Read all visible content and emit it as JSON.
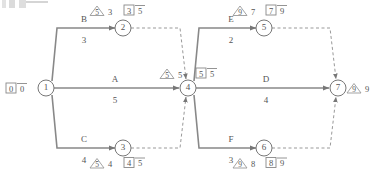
{
  "diagram": {
    "kind": "activity-on-arrow-network",
    "nodes": [
      {
        "id": "n1",
        "label": "1",
        "cx": 46,
        "cy": 88,
        "box": {
          "early": "0",
          "late": "0"
        },
        "box_pos": {
          "x": 14,
          "y": 88
        },
        "triangle": null
      },
      {
        "id": "n2",
        "label": "2",
        "cx": 123,
        "cy": 28,
        "box": {
          "early": "3",
          "late": "5"
        },
        "box_pos": {
          "x": 139,
          "y": 11
        },
        "triangle": {
          "value": "5",
          "number": "3",
          "x": 98,
          "y": 11
        }
      },
      {
        "id": "n3",
        "label": "3",
        "cx": 123,
        "cy": 148,
        "box": {
          "early": "4",
          "late": "5"
        },
        "box_pos": {
          "x": 139,
          "y": 165
        },
        "triangle": {
          "value": "5",
          "number": "4",
          "x": 98,
          "y": 165
        }
      },
      {
        "id": "n4",
        "label": "4",
        "cx": 188,
        "cy": 88,
        "box": {
          "early": "5",
          "late": "5"
        },
        "box_pos": {
          "x": 212,
          "y": 71
        },
        "triangle": {
          "value": "5",
          "number": "5",
          "x": 170,
          "y": 71
        }
      },
      {
        "id": "n5",
        "label": "5",
        "cx": 264,
        "cy": 28,
        "box": {
          "early": "7",
          "late": "9"
        },
        "box_pos": {
          "x": 281,
          "y": 11
        },
        "triangle": {
          "value": "9",
          "number": "7",
          "x": 241,
          "y": 11
        }
      },
      {
        "id": "n6",
        "label": "6",
        "cx": 264,
        "cy": 148,
        "box": {
          "early": "8",
          "late": "9"
        },
        "box_pos": {
          "x": 281,
          "y": 165
        },
        "triangle": {
          "value": "9",
          "number": "8",
          "x": 241,
          "y": 165
        }
      },
      {
        "id": "n7",
        "label": "7",
        "cx": 338,
        "cy": 88,
        "box": null,
        "box_pos": null,
        "triangle": {
          "value": "9",
          "number": "9",
          "x": 353,
          "y": 88
        }
      }
    ],
    "activities": [
      {
        "id": "B",
        "name": "B",
        "duration": "3",
        "from": "n1",
        "to": "n2",
        "name_pos": {
          "x": 84,
          "y": 22
        },
        "dur_pos": {
          "x": 84,
          "y": 43
        }
      },
      {
        "id": "A",
        "name": "A",
        "duration": "5",
        "from": "n1",
        "to": "n4",
        "name_pos": {
          "x": 115,
          "y": 82
        },
        "dur_pos": {
          "x": 115,
          "y": 103
        }
      },
      {
        "id": "C",
        "name": "C",
        "duration": "4",
        "from": "n1",
        "to": "n3",
        "name_pos": {
          "x": 84,
          "y": 142
        },
        "dur_pos": {
          "x": 84,
          "y": 163
        }
      },
      {
        "id": "E",
        "name": "E",
        "duration": "2",
        "from": "n4",
        "to": "n5",
        "name_pos": {
          "x": 231,
          "y": 22
        },
        "dur_pos": {
          "x": 231,
          "y": 43
        }
      },
      {
        "id": "D",
        "name": "D",
        "duration": "4",
        "from": "n4",
        "to": "n7",
        "name_pos": {
          "x": 266,
          "y": 82
        },
        "dur_pos": {
          "x": 266,
          "y": 103
        }
      },
      {
        "id": "F",
        "name": "F",
        "duration": "3",
        "from": "n4",
        "to": "n6",
        "name_pos": {
          "x": 231,
          "y": 142
        },
        "dur_pos": {
          "x": 231,
          "y": 163
        }
      }
    ],
    "dummy_links": [
      {
        "from": "n2",
        "to": "n4",
        "style": "dashed"
      },
      {
        "from": "n3",
        "to": "n4",
        "style": "dashed"
      },
      {
        "from": "n5",
        "to": "n7",
        "style": "dashed"
      },
      {
        "from": "n6",
        "to": "n7",
        "style": "dashed"
      }
    ],
    "colors": {
      "line": "#888888",
      "dashed_line": "#999999",
      "text": "#555555",
      "background": "#ffffff"
    }
  }
}
